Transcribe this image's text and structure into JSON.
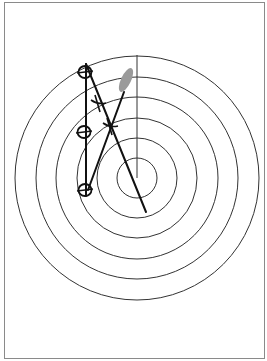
{
  "diagram": {
    "type": "radar-plotting-sheet",
    "center": [
      137,
      178
    ],
    "ring_radii": [
      122,
      101,
      81,
      60,
      40,
      20
    ],
    "heading_line": {
      "from": [
        137,
        55
      ],
      "to": [
        137,
        178
      ]
    },
    "colors": {
      "ring": "#333333",
      "ink": "#111111",
      "target_blob": "#9a9a9a",
      "border": "#8a8a8a"
    },
    "plots": [
      {
        "label": "plot-1",
        "x": 85,
        "y": 72
      },
      {
        "label": "plot-2",
        "x": 84,
        "y": 132
      },
      {
        "label": "plot-3",
        "x": 85,
        "y": 190
      }
    ],
    "marks": [
      {
        "label": "x-mark-1",
        "x": 98,
        "y": 103
      },
      {
        "label": "x-mark-2",
        "x": 110,
        "y": 126
      }
    ],
    "lines": [
      {
        "label": "relative-motion-line",
        "from": [
          86,
          64
        ],
        "to": [
          146,
          212
        ]
      },
      {
        "label": "own-track-line",
        "from": [
          86,
          64
        ],
        "to": [
          86,
          196
        ]
      },
      {
        "label": "true-track-line",
        "from": [
          88,
          190
        ],
        "to": [
          124,
          92
        ]
      }
    ],
    "target_blob": {
      "cx": 126,
      "cy": 80,
      "rx": 5,
      "ry": 13,
      "rotate": 25
    }
  }
}
